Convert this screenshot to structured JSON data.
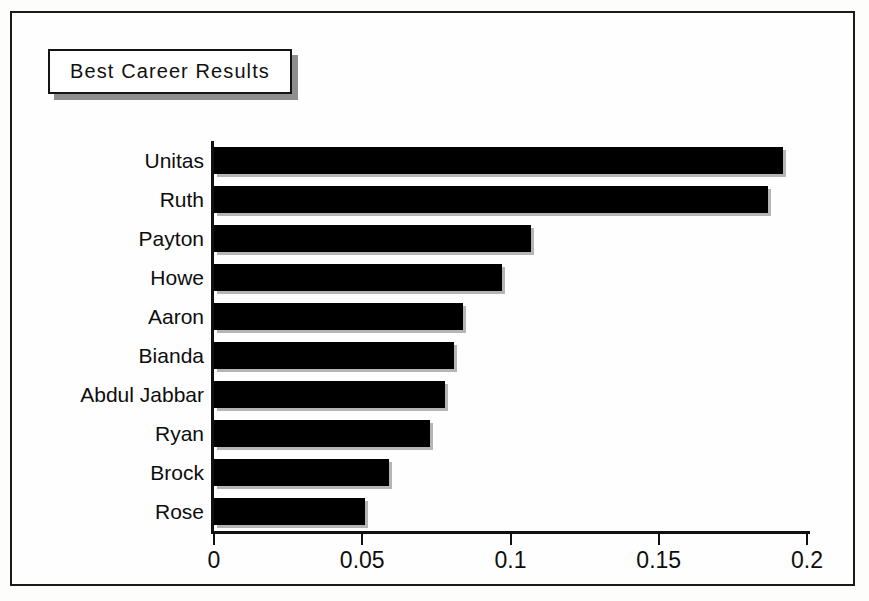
{
  "figure": {
    "title": "Best Career Results",
    "frame_color": "#1a1a1a",
    "background": "#fefefe",
    "bar_color": "#000000"
  },
  "chart_data": {
    "type": "bar",
    "orientation": "horizontal",
    "title": "Best Career Results",
    "xlabel": "",
    "ylabel": "",
    "categories": [
      "Unitas",
      "Ruth",
      "Payton",
      "Howe",
      "Aaron",
      "Bianda",
      "Abdul Jabbar",
      "Ryan",
      "Brock",
      "Rose"
    ],
    "values": [
      0.192,
      0.187,
      0.107,
      0.097,
      0.084,
      0.081,
      0.078,
      0.073,
      0.059,
      0.051
    ],
    "xlim": [
      0,
      0.2
    ],
    "xticks": [
      0,
      0.05,
      0.1,
      0.15,
      0.2
    ],
    "xticklabels": [
      "0",
      "0.05",
      "0.1",
      "0.15",
      "0.2"
    ],
    "grid": false,
    "legend": false
  }
}
